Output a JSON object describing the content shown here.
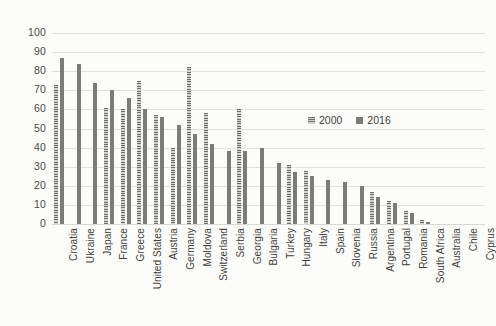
{
  "chart_data": {
    "type": "bar",
    "title": "",
    "subtitle": "",
    "xlabel": "",
    "ylabel": "",
    "ylim": [
      0,
      100
    ],
    "ytick_step": 10,
    "yticks": [
      100,
      90,
      80,
      70,
      60,
      50,
      40,
      30,
      20,
      10,
      0
    ],
    "grid": true,
    "legend_position": "inside-upper-right",
    "categories": [
      "Croatia",
      "Ukraine",
      "Japan",
      "France",
      "Greece",
      "United States",
      "Austria",
      "Germany",
      "Moldova",
      "Switzerland",
      "Serbia",
      "Georgia",
      "Bulgaria",
      "Turkey",
      "Hungary",
      "Italy",
      "Spain",
      "Slovenia",
      "Russia",
      "Argentina",
      "Portugal",
      "Romania",
      "South Africa",
      "Australia",
      "Chile",
      "Cyprus"
    ],
    "series": [
      {
        "name": "2000",
        "color": "#9d9d9b",
        "values": [
          73,
          0,
          0,
          61,
          60,
          75,
          57,
          40,
          82,
          58,
          0,
          60,
          0,
          0,
          31,
          28,
          0,
          0,
          0,
          17,
          12,
          7,
          2,
          0,
          0,
          0
        ]
      },
      {
        "name": "2016",
        "color": "#7b7b79",
        "values": [
          87,
          84,
          74,
          70,
          66,
          60,
          56,
          52,
          47,
          42,
          38,
          38,
          40,
          32,
          27,
          25,
          23,
          22,
          20,
          14,
          11,
          6,
          1,
          0,
          0,
          0
        ]
      }
    ],
    "legend": [
      "2000",
      "2016"
    ]
  },
  "colors": {
    "background": "#fcfcfa",
    "gridline": "#e2e2e0",
    "text": "#3f3f3d",
    "series_2000": "#9d9d9b",
    "series_2016": "#7b7b79"
  }
}
